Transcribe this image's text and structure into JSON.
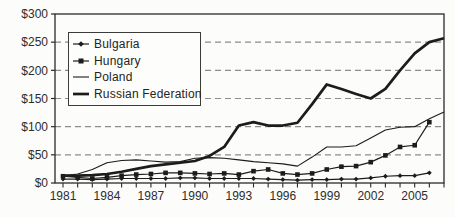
{
  "figure": {
    "background": "#fcfcfa"
  },
  "chart_data": {
    "type": "line",
    "title": "",
    "xlabel": "",
    "ylabel": "",
    "x": [
      1981,
      1982,
      1983,
      1984,
      1985,
      1986,
      1987,
      1988,
      1989,
      1990,
      1991,
      1992,
      1993,
      1994,
      1995,
      1996,
      1997,
      1998,
      1999,
      2000,
      2001,
      2002,
      2003,
      2004,
      2005,
      2006,
      2007
    ],
    "x_tick_labels": [
      "1981",
      "1984",
      "1987",
      "1990",
      "1993",
      "1996",
      "1999",
      "2002",
      "2005"
    ],
    "x_label_every": 3,
    "ylim": [
      0,
      300
    ],
    "ytick_step": 50,
    "y_tick_labels": [
      "$0",
      "$50",
      "$100",
      "$150",
      "$200",
      "$250",
      "$300"
    ],
    "grid": "horizontal-dashed",
    "legend_position": "upper-left-inside",
    "series": [
      {
        "name": "Bulgaria",
        "marker": "diamond",
        "line_width": 1.2,
        "color": "#1c1c1c",
        "values": [
          7,
          7,
          6,
          7,
          8,
          8,
          8,
          8,
          9,
          9,
          8,
          8,
          8,
          8,
          7,
          6,
          5,
          6,
          6,
          7,
          7,
          9,
          12,
          13,
          13,
          18,
          null
        ]
      },
      {
        "name": "Hungary",
        "marker": "square",
        "line_width": 1.2,
        "color": "#1c1c1c",
        "values": [
          12,
          10,
          8,
          10,
          13,
          15,
          16,
          18,
          18,
          17,
          16,
          17,
          15,
          21,
          24,
          17,
          15,
          17,
          24,
          29,
          30,
          37,
          49,
          64,
          67,
          108,
          null
        ]
      },
      {
        "name": "Poland",
        "marker": "none",
        "line_width": 1.1,
        "color": "#1c1c1c",
        "values": [
          13,
          16,
          24,
          36,
          40,
          41,
          39,
          37,
          38,
          44,
          45,
          44,
          41,
          38,
          36,
          34,
          30,
          46,
          64,
          64,
          66,
          80,
          94,
          99,
          100,
          114,
          126
        ]
      },
      {
        "name": "Russian Federation",
        "marker": "none",
        "line_width": 2.7,
        "color": "#1c1c1c",
        "values": [
          13,
          13,
          14,
          16,
          20,
          25,
          30,
          33,
          36,
          39,
          48,
          64,
          102,
          108,
          102,
          102,
          107,
          140,
          175,
          167,
          158,
          150,
          167,
          200,
          230,
          250,
          257
        ]
      }
    ],
    "colors": {
      "axis": "#2a2a2a",
      "grid": "#8c8c8c",
      "text": "#2d2d2d"
    }
  }
}
